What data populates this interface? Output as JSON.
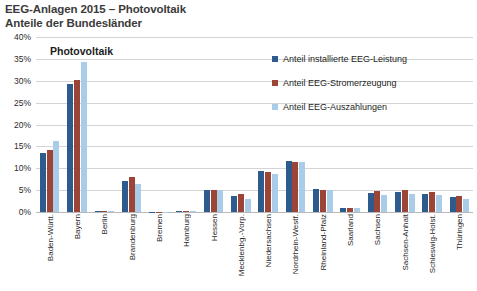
{
  "header": {
    "title_line1": "EEG-Anlagen 2015 – Photovoltaik",
    "title_line2": "Anteile der Bundesländer"
  },
  "colors": {
    "series1": "#2E5B8E",
    "series2": "#9C4436",
    "series3": "#A9CCE9",
    "grid": "#d4d4d4",
    "axis": "#b9b9b9",
    "title_text": "#3b3b3b"
  },
  "chart_data": {
    "type": "bar",
    "title": "Photovoltaik",
    "xlabel": "",
    "ylabel": "",
    "ylim": [
      0,
      40
    ],
    "ytick_labels": [
      "0%",
      "5%",
      "10%",
      "15%",
      "20%",
      "25%",
      "30%",
      "35%",
      "40%"
    ],
    "ytick_values": [
      0,
      5,
      10,
      15,
      20,
      25,
      30,
      35,
      40
    ],
    "grid": true,
    "legend_position": "top-right",
    "categories": [
      "Baden-Württ.",
      "Bayern",
      "Berlin",
      "Brandenburg",
      "Bremen",
      "Hamburg",
      "Hessen",
      "Mecklenbg.-Vorp.",
      "Niedersachsen",
      "Nordrhein-Westf.",
      "Rheinland-Pfalz",
      "Saarland",
      "Sachsen",
      "Sachsen-Anhalt",
      "Schleswig-Holst.",
      "Thüringen"
    ],
    "series": [
      {
        "name": "Anteil installierte EEG-Leistung",
        "color": "#2E5B8E",
        "values": [
          13.5,
          29.2,
          0.3,
          7.2,
          0.1,
          0.2,
          5.1,
          3.6,
          9.3,
          11.6,
          5.2,
          0.9,
          4.4,
          4.6,
          4.1,
          3.4
        ]
      },
      {
        "name": "Anteil EEG-Stromerzeugung",
        "color": "#9C4436",
        "values": [
          14.2,
          30.2,
          0.3,
          7.9,
          0.1,
          0.2,
          5.0,
          4.1,
          9.2,
          11.5,
          5.1,
          0.9,
          4.7,
          5.0,
          4.5,
          3.7
        ]
      },
      {
        "name": "Anteil EEG-Auszahlungen",
        "color": "#A9CCE9",
        "values": [
          16.3,
          34.4,
          0.3,
          6.3,
          0.1,
          0.2,
          5.1,
          3.0,
          8.8,
          11.4,
          5.1,
          1.0,
          4.0,
          4.2,
          4.0,
          2.9
        ]
      }
    ]
  },
  "legend": {
    "items": [
      {
        "label": "Anteil installierte EEG-Leistung",
        "color": "#2E5B8E"
      },
      {
        "label": "Anteil EEG-Stromerzeugung",
        "color": "#9C4436"
      },
      {
        "label": "Anteil EEG-Auszahlungen",
        "color": "#A9CCE9"
      }
    ]
  }
}
